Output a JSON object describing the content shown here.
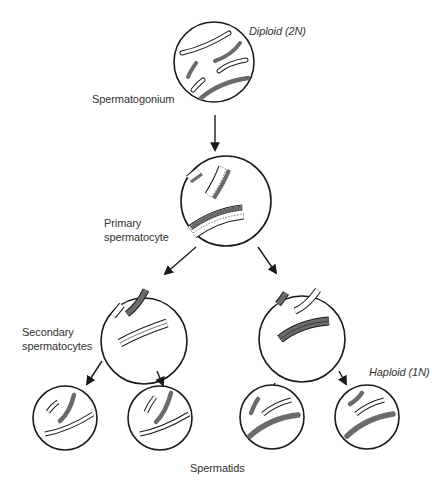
{
  "colors": {
    "outline": "#1a1a1a",
    "dark_chromosome": "#6b6b6b",
    "light_chromosome": "#ffffff",
    "background": "#ffffff"
  },
  "labels": {
    "diploid": "Diploid (2N)",
    "spermatogonium": "Spermatogonium",
    "primary_line1": "Primary",
    "primary_line2": "spermatocyte",
    "secondary_line1": "Secondary",
    "secondary_line2": "spermatocytes",
    "haploid": "Haploid (1N)",
    "spermatids": "Spermatids"
  },
  "stages": [
    {
      "name": "Spermatogonium",
      "ploidy": "Diploid (2N)",
      "cells": 1
    },
    {
      "name": "Primary spermatocyte",
      "cells": 1
    },
    {
      "name": "Secondary spermatocytes",
      "cells": 2
    },
    {
      "name": "Spermatids",
      "ploidy": "Haploid (1N)",
      "cells": 4
    }
  ]
}
